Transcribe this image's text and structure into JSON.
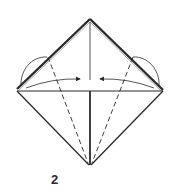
{
  "diagram": {
    "type": "origami-step",
    "step_number": "2",
    "colors": {
      "line": "#2a2a2a",
      "paper": "#ffffff",
      "edge_highlight": "#888888"
    },
    "shape": {
      "apex": [
        90,
        20
      ],
      "left_corner": [
        17,
        90
      ],
      "right_corner": [
        163,
        91
      ],
      "bottom": [
        90,
        165
      ]
    },
    "annotations": [
      {
        "name": "valley-fold-left",
        "kind": "dashed-line"
      },
      {
        "name": "valley-fold-right",
        "kind": "dashed-line"
      },
      {
        "name": "fold-arrow-left",
        "kind": "arrow-to-center"
      },
      {
        "name": "fold-arrow-right",
        "kind": "arrow-to-center"
      },
      {
        "name": "flap-arc-left",
        "kind": "arc"
      },
      {
        "name": "flap-arc-right",
        "kind": "arc"
      }
    ]
  }
}
